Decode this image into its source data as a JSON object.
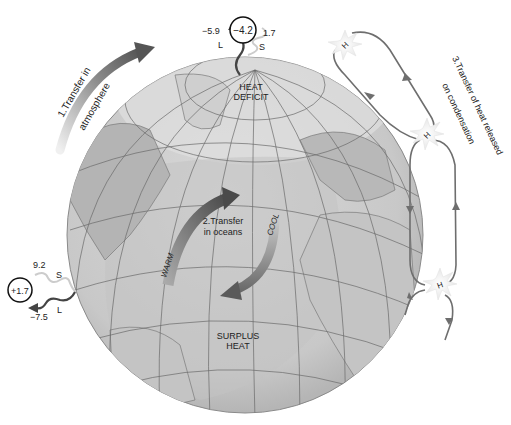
{
  "diagram": {
    "labels": {
      "transfer_atmosphere_line1": "1.Transfer in",
      "transfer_atmosphere_line2": "atmosphere",
      "transfer_oceans_line1": "2.Transfer",
      "transfer_oceans_line2": "in oceans",
      "transfer_condensation_line1": "3.Transfer of heat released",
      "transfer_condensation_line2": "on condensation",
      "heat_deficit_line1": "HEAT",
      "heat_deficit_line2": "DEFICIT",
      "surplus_heat_line1": "SURPLUS",
      "surplus_heat_line2": "HEAT",
      "warm": "WARM",
      "cool": "COOL"
    },
    "north_budget": {
      "longwave_value": "−5.9",
      "longwave_label": "L",
      "net_value": "−4.2",
      "shortwave_value": "1.7",
      "shortwave_label": "S"
    },
    "south_budget": {
      "shortwave_value": "9.2",
      "shortwave_label": "S",
      "net_value": "+1.7",
      "longwave_value": "−7.5",
      "longwave_label": "L"
    },
    "high_pressure_markers": [
      "H",
      "H",
      "H"
    ],
    "colors": {
      "globe_land": "#bdbdbd",
      "globe_ocean": "#d4d4d4",
      "polar_cap": "#dcdcdc",
      "grid_lines": "#6a6a6a",
      "arrow_dark": "#555555",
      "arrow_light": "#cfcfcf",
      "circulation_line": "#6e6e6e"
    }
  }
}
